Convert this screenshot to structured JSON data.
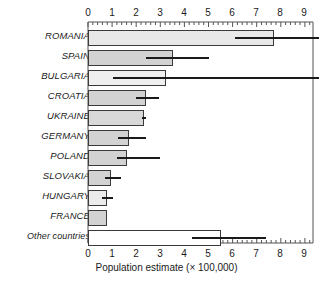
{
  "chart_data": {
    "type": "bar",
    "orientation": "horizontal",
    "title": "",
    "xlabel": "Population estimate (× 100,000)",
    "ylabel": "",
    "xlim": [
      0,
      9.6
    ],
    "xticks": [
      0,
      1,
      2,
      3,
      4,
      5,
      6,
      7,
      8,
      9
    ],
    "xticklabels": [
      "0",
      "1",
      "2",
      "3",
      "4",
      "5",
      "6",
      "7",
      "8",
      "9"
    ],
    "minor_ticks_per_interval": 4,
    "grid": false,
    "axis_on_both_top_and_bottom": true,
    "error_bar_style": "horizontal-line-confidence-interval",
    "categories": [
      "ROMANIA",
      "SPAIN",
      "BULGARIA",
      "CROATIA",
      "UKRAINE",
      "GERMANY",
      "POLAND",
      "SLOVAKIA",
      "HUNGARY",
      "FRANCE",
      "Other countries"
    ],
    "values": [
      7.7,
      3.5,
      3.2,
      2.4,
      2.3,
      1.7,
      1.6,
      0.95,
      0.75,
      0.75,
      5.5
    ],
    "ci_low": [
      6.1,
      2.4,
      1.05,
      2.0,
      2.25,
      1.25,
      1.2,
      0.7,
      0.6,
      null,
      4.3
    ],
    "ci_high": [
      9.6,
      5.0,
      9.6,
      2.95,
      2.4,
      2.4,
      3.0,
      1.35,
      1.05,
      null,
      7.4
    ],
    "bar_fill_colors": [
      "#e8e8e8",
      "#d2d2d2",
      "#efefef",
      "#d2d2d2",
      "#d8d8d8",
      "#d2d2d2",
      "#d2d2d2",
      "#d2d2d2",
      "#ebebeb",
      "#d2d2d2",
      "#ffffff"
    ],
    "bar_edge_color": "#3a3a3a",
    "error_bar_color": "#1a1a1a",
    "axis_color": "#555555",
    "text_color": "#1a1a1a"
  },
  "axis": {
    "tick_labels": [
      "0",
      "1",
      "2",
      "3",
      "4",
      "5",
      "6",
      "7",
      "8",
      "9"
    ],
    "x_axis_title": "Population estimate (× 100,000)"
  },
  "labels": {
    "items": [
      "ROMANIA",
      "SPAIN",
      "BULGARIA",
      "CROATIA",
      "UKRAINE",
      "GERMANY",
      "POLAND",
      "SLOVAKIA",
      "HUNGARY",
      "FRANCE",
      "Other countries"
    ]
  }
}
